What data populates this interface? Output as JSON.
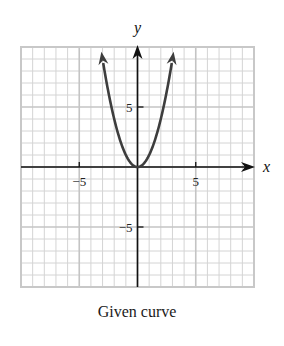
{
  "chart_data": {
    "type": "line",
    "title": "",
    "caption": "Given curve",
    "equation": "y = x^2",
    "xlabel": "x",
    "ylabel": "y",
    "xlim": [
      -10,
      10
    ],
    "ylim": [
      -10,
      10
    ],
    "grid": true,
    "grid_minor_step": 1,
    "grid_major_step": 5,
    "x_tick_labels": [
      {
        "value": -5,
        "label": "−5"
      },
      {
        "value": 5,
        "label": "5"
      }
    ],
    "y_tick_labels": [
      {
        "value": 5,
        "label": "5"
      },
      {
        "value": -5,
        "label": "−5"
      }
    ],
    "series": [
      {
        "name": "Given curve",
        "x": [
          -3.1,
          -3,
          -2.5,
          -2,
          -1.5,
          -1,
          -0.5,
          0,
          0.5,
          1,
          1.5,
          2,
          2.5,
          3,
          3.1
        ],
        "y": [
          9.61,
          9,
          6.25,
          4,
          2.25,
          1,
          0.25,
          0,
          0.25,
          1,
          2.25,
          4,
          6.25,
          9,
          9.61
        ],
        "arrows_at_ends": true
      }
    ],
    "colors": {
      "curve": "#3d3d3d",
      "axes": "#111111",
      "grid_minor": "#d4d4d4",
      "grid_major": "#c4c4c4",
      "border": "#c8c8c8"
    }
  },
  "labels": {
    "axis_x": "x",
    "axis_y": "y",
    "caption": "Given curve"
  }
}
